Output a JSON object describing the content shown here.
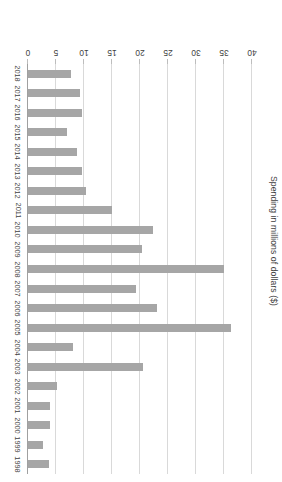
{
  "chart_data": {
    "type": "bar",
    "orientation": "horizontal",
    "title": "",
    "subtitle": "",
    "xlabel": "Spending in millions of dollars ($)",
    "ylabel": "",
    "axis_title": "Spending in millions of dollars ($)",
    "categories": [
      "1998",
      "1999",
      "2000",
      "2001",
      "2002",
      "2003",
      "2004",
      "2005",
      "2006",
      "2007",
      "2008",
      "2009",
      "2010",
      "2011",
      "2012",
      "2013",
      "2014",
      "2015",
      "2016",
      "2017",
      "2018"
    ],
    "values": [
      3.7,
      2.6,
      4.0,
      4.0,
      5.1,
      20.5,
      8.0,
      36.2,
      23.0,
      19.3,
      35.0,
      20.3,
      22.3,
      15.0,
      10.3,
      9.6,
      8.8,
      6.9,
      9.7,
      9.3,
      7.6
    ],
    "value_axis_ticks": [
      "0",
      "5",
      "10",
      "15",
      "20",
      "25",
      "30",
      "35",
      "40"
    ],
    "tick_values": [
      0,
      5,
      10,
      15,
      20,
      25,
      30,
      35,
      40
    ],
    "xlim": [
      0,
      40
    ],
    "ylim": [
      0,
      40
    ],
    "grid": true,
    "grid_axis": "value",
    "legend": false,
    "legend_position": "none",
    "units": "millions of dollars",
    "rotation_note": "figure rendered rotated 180 degrees",
    "series": [
      {
        "name": "Spending",
        "values": [
          3.7,
          2.6,
          4.0,
          4.0,
          5.1,
          20.5,
          8.0,
          36.2,
          23.0,
          19.3,
          35.0,
          20.3,
          22.3,
          15.0,
          10.3,
          9.6,
          8.8,
          6.9,
          9.7,
          9.3,
          7.6
        ]
      }
    ]
  },
  "style": {
    "bar_color": "#a6a6a6",
    "grid_color": "#d9d9d9",
    "axis_color": "#a0a0a0",
    "text_color": "#3f3f3f",
    "background": "#ffffff"
  }
}
